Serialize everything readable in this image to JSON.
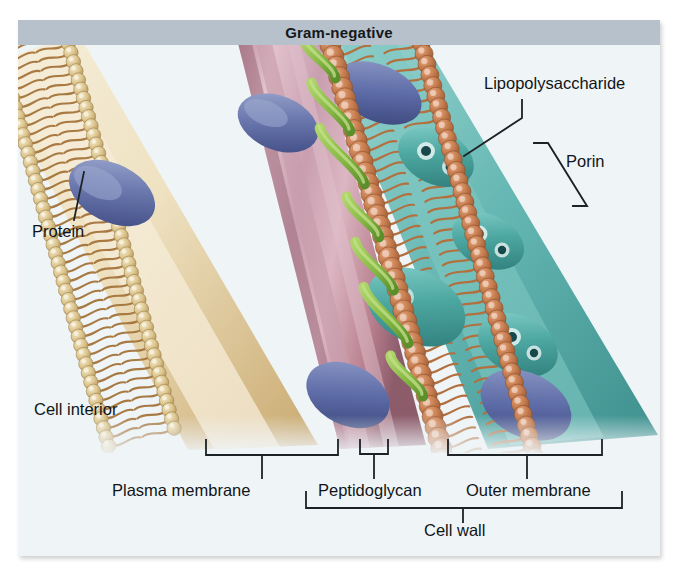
{
  "figure": {
    "title": "Gram-negative",
    "background_color": "#eef3f6",
    "titlebar_color": "#b6c1cb"
  },
  "labels": {
    "lipopolysaccharide": "Lipopolysaccharide",
    "porin": "Porin",
    "protein": "Protein",
    "cell_interior": "Cell interior",
    "plasma_membrane": "Plasma membrane",
    "peptidoglycan": "Peptidoglycan",
    "outer_membrane": "Outer membrane",
    "cell_wall": "Cell wall"
  },
  "structures": {
    "plasma_membrane": {
      "name": "Plasma membrane",
      "head_color": "#d9c48a",
      "tail_color": "#a5743a",
      "core_color": "#f3ead3",
      "protein_color": "#6c7bb0"
    },
    "peptidoglycan": {
      "name": "Peptidoglycan",
      "color": "#cfa0ae",
      "shade_color": "#a97284"
    },
    "outer_membrane": {
      "name": "Outer membrane",
      "head_color": "#c9794f",
      "tail_color": "#b2703f",
      "lps_chain_color": "#8cbb4d",
      "porin_color": "#4fa9a2",
      "protein_color": "#5b6aa6",
      "core_color": "#6fc0bd"
    }
  },
  "annotations": {
    "leader_lines": [
      "lipopolysaccharide",
      "protein"
    ],
    "brackets": [
      "plasma-membrane",
      "peptidoglycan",
      "outer-membrane",
      "porin",
      "cell-wall"
    ],
    "bracket_color": "#1d2226"
  }
}
